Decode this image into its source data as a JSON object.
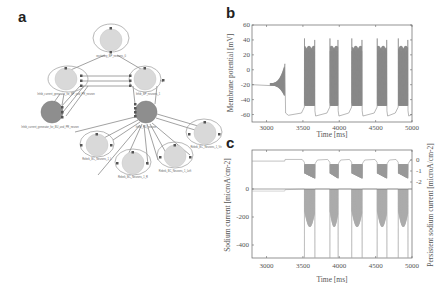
{
  "figure": {
    "panels": [
      {
        "label": "a",
        "type": "diagram",
        "description": "Network graph of populations and projections"
      },
      {
        "label": "b",
        "type": "line"
      },
      {
        "label": "c",
        "type": "line"
      }
    ]
  },
  "diagram": {
    "nodes": [
      {
        "id": "top",
        "label": "excitatory_BP_neurons_0",
        "shade": "light"
      },
      {
        "id": "left",
        "label": "Inhib_current_generator_for_BP_and_PR_neuron",
        "shade": "light"
      },
      {
        "id": "right",
        "label": "Inhib_BP_neurons_1",
        "shade": "light"
      },
      {
        "id": "dark-left",
        "label": "Inhib_current_generator_for_BU_and_PR_neuron",
        "shade": "dark"
      },
      {
        "id": "dark-center",
        "label": "Inhib_RU_neuron",
        "shade": "dark"
      },
      {
        "id": "bl",
        "label": "Rebek_BC_Neurons_1_L",
        "shade": "light"
      },
      {
        "id": "bc",
        "label": "Rebek_BC_Neurons_1_R",
        "shade": "light"
      },
      {
        "id": "br",
        "label": "Rebek_BC_Neurons_1_Left",
        "shade": "light"
      },
      {
        "id": "far-right",
        "label": "Rebek_BC_Neurons_1_Ve",
        "shade": "light"
      }
    ]
  },
  "chart_data": [
    {
      "panel": "b",
      "type": "line",
      "title": "",
      "xlabel": "Time [ms]",
      "ylabel": "Membrane potential [mV]",
      "xlim": [
        2800,
        5000
      ],
      "ylim": [
        -70,
        60
      ],
      "xticks": [
        3000,
        3500,
        4000,
        4500,
        5000
      ],
      "yticks": [
        60,
        40,
        20,
        0,
        -20,
        -40,
        -60
      ],
      "grid": false,
      "series": [
        {
          "name": "membrane potential",
          "description": "Resting near -20 mV until ~3250 ms with growing oscillation peaking ~8 mV, then drops to ~-60 mV; bursts of spiking (peaks ~40 mV, plateaus ~30 to -50 mV) at ~3520-3670, 3870-3980, 4170-4320, 4520-4650, 4810-4940 ms",
          "bursts_ms": [
            [
              3520,
              3670
            ],
            [
              3870,
              3990
            ],
            [
              4170,
              4320
            ],
            [
              4520,
              4660
            ],
            [
              4810,
              4950
            ]
          ],
          "baseline_pre": -20,
          "baseline_post": -60,
          "spike_peak": 42
        }
      ]
    },
    {
      "panel": "c",
      "type": "line",
      "title": "",
      "xlabel": "Time [ms]",
      "ylabel": "Sodium current [microA/cm-2]",
      "ylabel_right": "Persistent sodium current [microA/cm-2]",
      "xlim": [
        2800,
        5000
      ],
      "ylim": [
        -500,
        0
      ],
      "ylim_right": [
        -2.3,
        0.2
      ],
      "xticks": [
        3000,
        3500,
        4000,
        4500,
        5000
      ],
      "yticks": [
        0,
        -200,
        -400
      ],
      "yticks_right": [
        0,
        -1,
        -2
      ],
      "grid": false,
      "series": [
        {
          "name": "Sodium current",
          "axis": "left",
          "baseline": 0,
          "description": "Deep negative transients (to below -500) during bursts"
        },
        {
          "name": "Persistent sodium current",
          "axis": "right",
          "baseline_pre": -0.1,
          "baseline_post": 0.05,
          "description": "Dips toward -1.5 to -2 during bursts"
        }
      ]
    }
  ],
  "panel_b": {
    "ylabel": "Membrane potential [mV]",
    "xlabel": "Time [ms]",
    "yticks": [
      "60",
      "40",
      "20",
      "0",
      "-20",
      "-40",
      "-60"
    ],
    "xticks": [
      "3000",
      "3500",
      "4000",
      "4500",
      "5000"
    ]
  },
  "panel_c": {
    "ylabel": "Sodium current [microA/cm-2]",
    "ylabel_right": "Persistent sodium current [microA/cm-2]",
    "xlabel": "Time [ms]",
    "yticks": [
      "0",
      "-200",
      "-400"
    ],
    "yticks_right": [
      "0",
      "-1",
      "-2"
    ],
    "xticks": [
      "3000",
      "3500",
      "4000",
      "4500",
      "5000"
    ]
  },
  "labels": {
    "a": "a",
    "b": "b",
    "c": "c"
  }
}
